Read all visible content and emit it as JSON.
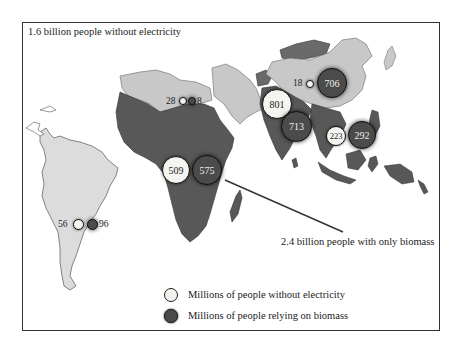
{
  "title": "1.6 billion people without electricity",
  "callout": "2.4 billion people with only biomass",
  "legend": {
    "items": [
      {
        "label": "Millions of people without electricity",
        "style": "light",
        "color": "#f2f2ee"
      },
      {
        "label": "Millions of people relying on biomass",
        "style": "dark",
        "color": "#4a4a4a"
      }
    ]
  },
  "regions": [
    {
      "name": "Latin America",
      "without_electricity": "56",
      "biomass": "96"
    },
    {
      "name": "North Africa",
      "without_electricity": "28",
      "biomass": "8"
    },
    {
      "name": "Sub-Saharan Africa",
      "without_electricity": "509",
      "biomass": "575"
    },
    {
      "name": "South Asia",
      "without_electricity": "801",
      "biomass": "713"
    },
    {
      "name": "China",
      "without_electricity": "18",
      "biomass": "706"
    },
    {
      "name": "Southeast Asia",
      "without_electricity": "223",
      "biomass": "292"
    }
  ],
  "colors": {
    "land_light": "#d8d8d8",
    "land_dark": "#5a5a5a",
    "land_mid": "#bdbdbd",
    "frame": "#333333"
  }
}
